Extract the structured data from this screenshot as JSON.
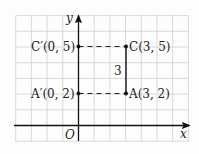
{
  "diagram": {
    "type": "coordinate-plane",
    "axes": {
      "x_label": "x",
      "y_label": "y",
      "origin_label": "O"
    },
    "grid": {
      "x_range": [
        -4,
        7
      ],
      "y_range": [
        -1,
        7
      ],
      "unit": 1
    },
    "points": [
      {
        "id": "C_prime",
        "name": "C′",
        "coords": "(0, 5)",
        "x": 0,
        "y": 5,
        "label": "C′(0, 5)"
      },
      {
        "id": "C",
        "name": "C",
        "coords": "(3, 5)",
        "x": 3,
        "y": 5,
        "label": "C(3, 5)"
      },
      {
        "id": "A_prime",
        "name": "A′",
        "coords": "(0, 2)",
        "x": 0,
        "y": 2,
        "label": "A′(0, 2)"
      },
      {
        "id": "A",
        "name": "A",
        "coords": "(3, 2)",
        "x": 3,
        "y": 2,
        "label": "A(3, 2)"
      }
    ],
    "segments": [
      {
        "from": "A",
        "to": "C",
        "style": "solid",
        "length_label": "3"
      },
      {
        "from": "C_prime",
        "to": "C",
        "style": "dashed"
      },
      {
        "from": "A_prime",
        "to": "A",
        "style": "dashed"
      }
    ],
    "colors": {
      "grid": "#cfcfcf",
      "axis": "#111111",
      "text": "#222222"
    }
  }
}
